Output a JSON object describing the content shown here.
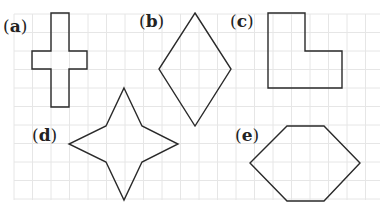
{
  "figure": {
    "background": "#ffffff",
    "grid": {
      "spacing": 18.5,
      "color": "#e6e6e6",
      "x0": 14,
      "y0": 14,
      "x1": 380,
      "y1": 200
    },
    "stroke": "#2a2a2a",
    "shapes": [
      {
        "id": "a",
        "label": "(a)",
        "letter": "a",
        "name": "cross",
        "points": "51,13 69,13 69,51 87,51 87,69 69,69 69,107 51,107 51,69 32,69 32,51 51,51",
        "label_x": 3,
        "label_y": 32
      },
      {
        "id": "b",
        "label": "(b)",
        "letter": "b",
        "name": "rhombus",
        "points": "195,13 231,69 195,126 159,69",
        "label_x": 139,
        "label_y": 27
      },
      {
        "id": "c",
        "label": "(c)",
        "letter": "c",
        "name": "l-shape",
        "points": "268,13 305,13 305,51 342,51 342,88 268,88",
        "label_x": 230,
        "label_y": 27
      },
      {
        "id": "d",
        "label": "(d)",
        "letter": "d",
        "name": "four-point-star",
        "points": "124,88 142,126 178,144 142,162 124,200 106,162 69,144 106,126",
        "label_x": 32,
        "label_y": 141
      },
      {
        "id": "e",
        "label": "(e)",
        "letter": "e",
        "name": "hexagon",
        "points": "287,126 324,126 360,163 324,201 287,201 250,163",
        "label_x": 235,
        "label_y": 141
      }
    ]
  }
}
